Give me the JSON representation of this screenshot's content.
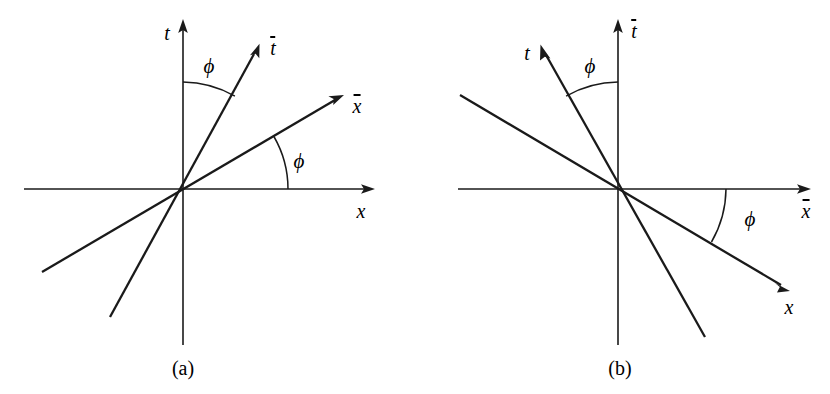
{
  "figure": {
    "background_color": "#ffffff",
    "stroke_color": "#1a1a1a",
    "width": 830,
    "height": 394
  },
  "panels": [
    {
      "id": "a",
      "caption": "(a)",
      "origin": {
        "x": 183,
        "y": 189
      },
      "labels": {
        "t_axis": "t",
        "x_axis": "x",
        "t_bar_axis": "t",
        "x_bar_axis": "x",
        "angle_upper": "ϕ",
        "angle_lower": "ϕ"
      },
      "label_positions": {
        "t_axis": {
          "x": 167,
          "y": 33
        },
        "x_axis": {
          "x": 361,
          "y": 211
        },
        "t_bar_axis": {
          "x": 273,
          "y": 48
        },
        "x_bar_axis": {
          "x": 357,
          "y": 106
        },
        "angle_upper": {
          "x": 209,
          "y": 66
        },
        "angle_lower": {
          "x": 299,
          "y": 161
        },
        "caption": {
          "x": 183,
          "y": 368
        }
      },
      "axes": {
        "t": {
          "x1": 183,
          "y1": 345,
          "x2": 183,
          "y2": 22,
          "arrow": "up"
        },
        "x": {
          "x1": 24,
          "y1": 189,
          "x2": 372,
          "y2": 189,
          "arrow": "right"
        }
      },
      "frame_lines": {
        "t_bar": {
          "x1": 110,
          "y1": 317,
          "x2": 258,
          "y2": 47,
          "arrow": "up-right",
          "angle_deg": 28.7
        },
        "x_bar": {
          "x1": 42,
          "y1": 272,
          "x2": 341,
          "y2": 97,
          "arrow": "up-right",
          "angle_deg": 30.3
        }
      },
      "arcs": {
        "upper": {
          "radius": 107,
          "from_deg": 90,
          "to_deg": 61
        },
        "lower": {
          "radius": 105,
          "from_deg": 0,
          "to_deg": 30
        }
      }
    },
    {
      "id": "b",
      "caption": "(b)",
      "origin": {
        "x": 618,
        "y": 189
      },
      "labels": {
        "t_axis": "t",
        "x_axis": "x",
        "t_bar_axis": "t",
        "x_bar_axis": "x",
        "angle_upper": "ϕ",
        "angle_lower": "ϕ"
      },
      "label_positions": {
        "t_axis": {
          "x": 527,
          "y": 53
        },
        "x_axis": {
          "x": 789,
          "y": 307
        },
        "t_bar_axis": {
          "x": 634,
          "y": 31
        },
        "x_bar_axis": {
          "x": 806,
          "y": 211
        },
        "angle_upper": {
          "x": 590,
          "y": 66
        },
        "angle_lower": {
          "x": 750,
          "y": 219
        },
        "caption": {
          "x": 620,
          "y": 368
        }
      },
      "axes": {
        "t_bar": {
          "x1": 618,
          "y1": 345,
          "x2": 618,
          "y2": 22,
          "arrow": "up"
        },
        "x_bar": {
          "x1": 458,
          "y1": 189,
          "x2": 808,
          "y2": 189,
          "arrow": "right"
        }
      },
      "frame_lines": {
        "t": {
          "x1": 705,
          "y1": 337,
          "x2": 541,
          "y2": 46,
          "arrow": "up-left",
          "angle_deg": 60.6
        },
        "x": {
          "x1": 460,
          "y1": 95,
          "x2": 788,
          "y2": 290,
          "arrow": "down-right",
          "angle_deg": -30.7
        }
      },
      "arcs": {
        "upper": {
          "radius": 107,
          "from_deg": 90,
          "to_deg": 119
        },
        "lower": {
          "radius": 108,
          "from_deg": 0,
          "to_deg": -30
        }
      }
    }
  ]
}
